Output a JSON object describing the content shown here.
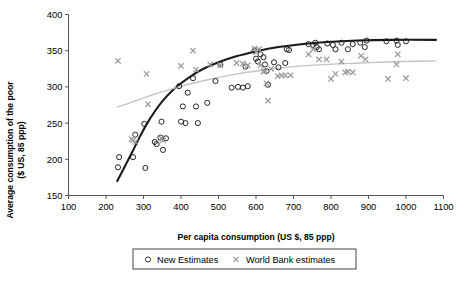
{
  "chart_data": {
    "type": "scatter",
    "title": "",
    "xlabel": "Per capita consumption (US $, 85 ppp)",
    "ylabel": "Average consumption of the poor ($ US, 85 ppp)",
    "xlim": [
      100,
      1100
    ],
    "ylim": [
      150,
      400
    ],
    "xticks": [
      100,
      200,
      300,
      400,
      500,
      600,
      700,
      800,
      900,
      1000,
      1100
    ],
    "yticks": [
      150,
      200,
      250,
      300,
      350,
      400
    ],
    "grid": false,
    "legend_position": "bottom",
    "series": [
      {
        "name": "New Estimates",
        "marker": "circle",
        "color": "#1a1a1a",
        "points": [
          [
            232,
            189
          ],
          [
            235,
            203
          ],
          [
            272,
            203
          ],
          [
            278,
            234
          ],
          [
            302,
            249
          ],
          [
            305,
            188
          ],
          [
            330,
            224
          ],
          [
            335,
            221
          ],
          [
            345,
            230
          ],
          [
            348,
            252
          ],
          [
            352,
            213
          ],
          [
            360,
            229
          ],
          [
            395,
            301
          ],
          [
            400,
            252
          ],
          [
            405,
            273
          ],
          [
            412,
            250
          ],
          [
            418,
            292
          ],
          [
            432,
            312
          ],
          [
            440,
            273
          ],
          [
            445,
            250
          ],
          [
            470,
            278
          ],
          [
            492,
            308
          ],
          [
            505,
            331
          ],
          [
            535,
            299
          ],
          [
            552,
            300
          ],
          [
            565,
            299
          ],
          [
            572,
            328
          ],
          [
            578,
            301
          ],
          [
            596,
            350
          ],
          [
            600,
            339
          ],
          [
            605,
            335
          ],
          [
            612,
            345
          ],
          [
            620,
            341
          ],
          [
            624,
            331
          ],
          [
            628,
            322
          ],
          [
            632,
            303
          ],
          [
            648,
            334
          ],
          [
            660,
            327
          ],
          [
            678,
            333
          ],
          [
            682,
            352
          ],
          [
            688,
            351
          ],
          [
            740,
            359
          ],
          [
            752,
            358
          ],
          [
            758,
            361
          ],
          [
            762,
            355
          ],
          [
            768,
            352
          ],
          [
            790,
            360
          ],
          [
            805,
            358
          ],
          [
            812,
            352
          ],
          [
            828,
            361
          ],
          [
            845,
            352
          ],
          [
            858,
            359
          ],
          [
            878,
            361
          ],
          [
            890,
            355
          ],
          [
            895,
            364
          ],
          [
            948,
            363
          ],
          [
            975,
            364
          ],
          [
            978,
            358
          ],
          [
            1000,
            363
          ]
        ]
      },
      {
        "name": "World Bank estimates",
        "marker": "x",
        "color": "#9a9a9a",
        "points": [
          [
            232,
            336
          ],
          [
            268,
            228
          ],
          [
            272,
            226
          ],
          [
            278,
            224
          ],
          [
            308,
            318
          ],
          [
            312,
            276
          ],
          [
            348,
            229
          ],
          [
            352,
            226
          ],
          [
            400,
            329
          ],
          [
            432,
            350
          ],
          [
            440,
            324
          ],
          [
            478,
            331
          ],
          [
            505,
            330
          ],
          [
            548,
            333
          ],
          [
            565,
            332
          ],
          [
            578,
            330
          ],
          [
            596,
            353
          ],
          [
            600,
            348
          ],
          [
            608,
            352
          ],
          [
            612,
            330
          ],
          [
            620,
            321
          ],
          [
            624,
            322
          ],
          [
            628,
            305
          ],
          [
            632,
            281
          ],
          [
            640,
            325
          ],
          [
            658,
            315
          ],
          [
            668,
            316
          ],
          [
            678,
            316
          ],
          [
            692,
            316
          ],
          [
            740,
            345
          ],
          [
            752,
            352
          ],
          [
            768,
            338
          ],
          [
            788,
            338
          ],
          [
            800,
            311
          ],
          [
            812,
            318
          ],
          [
            828,
            335
          ],
          [
            838,
            320
          ],
          [
            845,
            321
          ],
          [
            858,
            320
          ],
          [
            880,
            343
          ],
          [
            892,
            338
          ],
          [
            952,
            311
          ],
          [
            975,
            331
          ],
          [
            978,
            345
          ],
          [
            1000,
            312
          ]
        ]
      }
    ],
    "trendlines": [
      {
        "name": "New Estimates trend",
        "color": "#1a1a1a",
        "width": 2.1,
        "points": [
          [
            230,
            170
          ],
          [
            250,
            190
          ],
          [
            270,
            210
          ],
          [
            290,
            231
          ],
          [
            310,
            250
          ],
          [
            330,
            266
          ],
          [
            350,
            280
          ],
          [
            375,
            294
          ],
          [
            400,
            305
          ],
          [
            430,
            316
          ],
          [
            460,
            325
          ],
          [
            500,
            334
          ],
          [
            545,
            342
          ],
          [
            600,
            349
          ],
          [
            660,
            355
          ],
          [
            720,
            359
          ],
          [
            790,
            362
          ],
          [
            870,
            364
          ],
          [
            960,
            365
          ],
          [
            1080,
            365
          ]
        ]
      },
      {
        "name": "World Bank estimates trend",
        "color": "#c4c4c4",
        "width": 1.4,
        "points": [
          [
            230,
            272
          ],
          [
            280,
            281
          ],
          [
            330,
            290
          ],
          [
            380,
            298
          ],
          [
            430,
            305
          ],
          [
            490,
            312
          ],
          [
            550,
            318
          ],
          [
            620,
            323
          ],
          [
            700,
            328
          ],
          [
            790,
            331
          ],
          [
            880,
            333
          ],
          [
            980,
            335
          ],
          [
            1080,
            336
          ]
        ]
      }
    ],
    "legend": [
      {
        "label": "New Estimates",
        "marker": "circle",
        "color": "#1a1a1a"
      },
      {
        "label": "World Bank estimates",
        "marker": "x",
        "color": "#9a9a9a"
      }
    ]
  },
  "colors": {
    "axis": "#555555",
    "text": "#000000",
    "new_estimates": "#1a1a1a",
    "world_bank": "#9a9a9a",
    "new_trend": "#1a1a1a",
    "wb_trend": "#c4c4c4",
    "legend_border": "#444444",
    "background": "#ffffff"
  }
}
